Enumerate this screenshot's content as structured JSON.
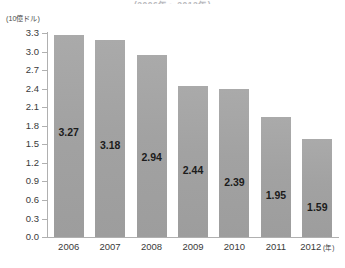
{
  "title_fragment": "(2006年〜2012年)",
  "unit_label": "(10億ドル)",
  "x_axis_unit": "(年)",
  "chart_data": {
    "type": "bar",
    "title": "(2006年〜2012年)",
    "xlabel": "(年)",
    "ylabel": "(10億ドル)",
    "categories": [
      "2006",
      "2007",
      "2008",
      "2009",
      "2010",
      "2011",
      "2012"
    ],
    "values": [
      3.27,
      3.18,
      2.94,
      2.44,
      2.39,
      1.95,
      1.59
    ],
    "value_labels": [
      "3.27",
      "3.18",
      "2.94",
      "2.44",
      "2.39",
      "1.95",
      "1.59"
    ],
    "ylim": [
      0.0,
      3.3
    ],
    "ytick_step": 0.3,
    "ytick_labels": [
      "3.3",
      "3.0",
      "2.7",
      "2.4",
      "2.1",
      "1.8",
      "1.5",
      "1.2",
      "0.9",
      "0.6",
      "0.3",
      "0.0"
    ],
    "grid": false,
    "legend": null,
    "bar_color": "#a5a5a5",
    "axis_color": "#b0b0b0",
    "text_color": "#3a3a3a"
  }
}
